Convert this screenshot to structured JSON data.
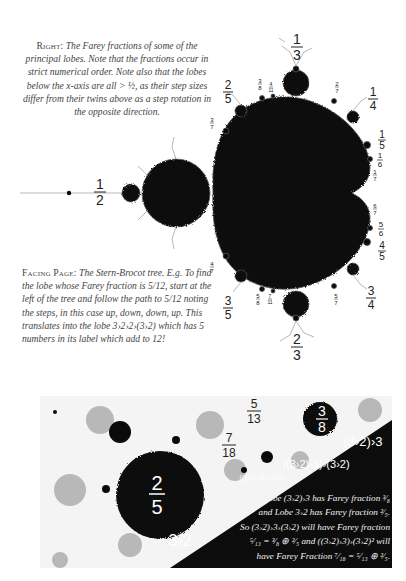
{
  "captions": {
    "right": {
      "lead": "Right:",
      "text": "The Farey fractions of some of the principal lobes. Note that the fractions occur in strict numerical order. Note also that the lobes below the x-axis are all > ½, as their step sizes differ from their twins above as a step rotation in the opposite direction."
    },
    "facing": {
      "lead": "Facing Page:",
      "text": "The Stern-Brocot tree. E.g. To find the lobe whose Farey fraction is 5/12, start at the left of the tree and follow the path to 5/12 noting the steps, in this case up, down, down, up. This translates into the lobe 3›2›2›(3›2) which has 5 numbers in its label which add to 12!"
    }
  },
  "top_figure": {
    "labels": {
      "half": {
        "n": "1",
        "d": "2"
      },
      "third": {
        "n": "1",
        "d": "3"
      },
      "two_thirds": {
        "n": "2",
        "d": "3"
      },
      "two_fifths": {
        "n": "2",
        "d": "5"
      },
      "three_fifths": {
        "n": "3",
        "d": "5"
      },
      "three_eighths": {
        "n": "3",
        "d": "8"
      },
      "four_elevenths": {
        "n": "4",
        "d": "11"
      },
      "two_sevenths": {
        "n": "2",
        "d": "7"
      },
      "quarter": {
        "n": "1",
        "d": "4"
      },
      "fifth": {
        "n": "1",
        "d": "5"
      },
      "sixth": {
        "n": "1",
        "d": "6"
      },
      "seventh": {
        "n": "1",
        "d": "7"
      },
      "three_sevenths": {
        "n": "3",
        "d": "7"
      },
      "four_sevenths": {
        "n": "4",
        "d": "7"
      },
      "five_eighths": {
        "n": "5",
        "d": "8"
      },
      "seven_elevenths": {
        "n": "7",
        "d": "11"
      },
      "five_sevenths": {
        "n": "5",
        "d": "7"
      },
      "three_quarters": {
        "n": "3",
        "d": "4"
      },
      "four_fifths": {
        "n": "4",
        "d": "5"
      },
      "five_sixths": {
        "n": "5",
        "d": "6"
      },
      "six_sevenths": {
        "n": "6",
        "d": "7"
      }
    }
  },
  "bottom_figure": {
    "labels": {
      "big_lobe": {
        "n": "2",
        "d": "5"
      },
      "small_lobe": {
        "n": "3",
        "d": "8"
      },
      "five_thirteenths": {
        "n": "5",
        "d": "13"
      },
      "seven_eighteenths": {
        "n": "7",
        "d": "18"
      },
      "lobe_3_2": "3›2",
      "lobe_3_2_3": "(3›2)›3",
      "lobe_nested": "((3›2)›3)›(3›2)",
      "lobe_nested_sq": "((3›2)›3)›(3›2)²"
    },
    "note_lines": [
      "Lobe (3›2)›3 has Farey fraction ³⁄₈",
      "and Lobe 3›2 has Farey fraction ²⁄₅.",
      "So (3›2)›3›(3›2) will have Farey fraction",
      "⁵⁄₁₃ = ³⁄₈ ⊕ ²⁄₅ and ((3›2)›3)›(3›2)² will",
      "have Farey Fraction ⁷⁄₁₈ = ⁵⁄₁₃ ⊕ ²⁄₅."
    ]
  }
}
